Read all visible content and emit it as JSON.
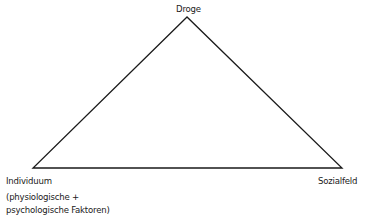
{
  "diagram": {
    "type": "triangle",
    "vertices": {
      "top": {
        "label": "Droge"
      },
      "bottom_left": {
        "label": "Individuum",
        "sublabel_line1": "(physiologische +",
        "sublabel_line2": "psychologische Faktoren)"
      },
      "bottom_right": {
        "label": "Sozialfeld"
      }
    },
    "line_color": "#1a1a1a"
  }
}
